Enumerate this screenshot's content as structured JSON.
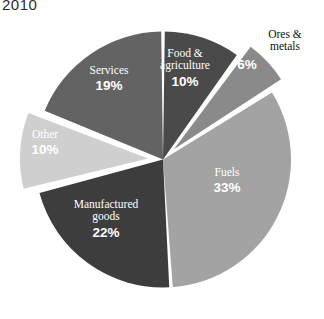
{
  "chart_data": {
    "type": "pie",
    "title": "2010",
    "xlabel": "",
    "ylabel": "",
    "legend_position": "none",
    "grid": false,
    "categories": [
      "Food & agriculture",
      "Ores & metals",
      "Fuels",
      "Manufactured goods",
      "Other",
      "Services"
    ],
    "values": [
      10,
      6,
      33,
      22,
      10,
      19
    ],
    "value_labels": [
      "10%",
      "6%",
      "33%",
      "22%",
      "10%",
      "19%"
    ],
    "units": "percent",
    "slices": [
      {
        "name": "Food & agriculture",
        "label_line1": "Food &",
        "label_line2": "agriculture",
        "value": 10,
        "value_label": "10%",
        "color": "#4a4a4a",
        "label_color": "#ffffff",
        "label_placement": "inside",
        "exploded": false
      },
      {
        "name": "Ores & metals",
        "label_line1": "Ores &",
        "label_line2": "metals",
        "value": 6,
        "value_label": "6%",
        "color": "#8a8a8a",
        "label_color": "#111111",
        "label_placement": "outside",
        "exploded": true
      },
      {
        "name": "Fuels",
        "label_line1": "Fuels",
        "label_line2": "",
        "value": 33,
        "value_label": "33%",
        "color": "#a3a3a3",
        "label_color": "#ffffff",
        "label_placement": "inside",
        "exploded": false
      },
      {
        "name": "Manufactured goods",
        "label_line1": "Manufactured",
        "label_line2": "goods",
        "value": 22,
        "value_label": "22%",
        "color": "#3d3d3d",
        "label_color": "#ffffff",
        "label_placement": "inside",
        "exploded": false
      },
      {
        "name": "Other",
        "label_line1": "Other",
        "label_line2": "",
        "value": 10,
        "value_label": "10%",
        "color": "#cfcfcf",
        "label_color": "#ffffff",
        "label_placement": "inside",
        "exploded": true
      },
      {
        "name": "Services",
        "label_line1": "Services",
        "label_line2": "",
        "value": 19,
        "value_label": "19%",
        "color": "#636363",
        "label_color": "#ffffff",
        "label_placement": "inside",
        "exploded": false
      }
    ],
    "background_color": "#ffffff",
    "separator_color": "#ffffff"
  }
}
